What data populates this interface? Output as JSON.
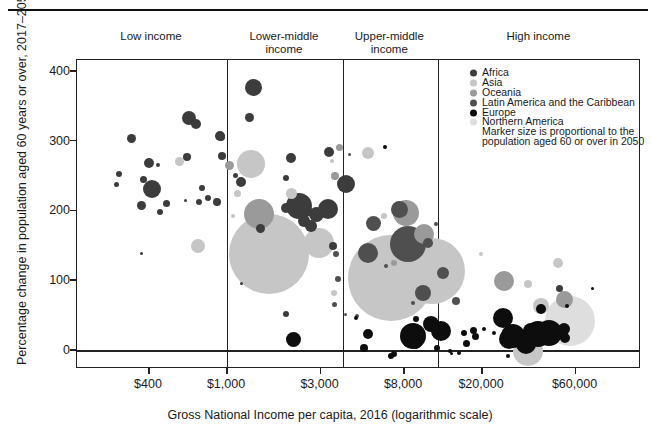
{
  "figure": {
    "y_axis_title": "Percentage change in population aged 60 years or over, 2017–2050",
    "x_axis_title": "Gross National Income per capita, 2016 (logarithmic scale)",
    "income_groups": [
      "Low income",
      "Lower-middle\nincome",
      "Upper-middle\nincome",
      "High income"
    ],
    "legend": {
      "items": [
        {
          "label": "Africa",
          "color": "#3c3c3c"
        },
        {
          "label": "Asia",
          "color": "#c6c6c6"
        },
        {
          "label": "Oceania",
          "color": "#9a9a9a"
        },
        {
          "label": "Latin America and the Caribbean",
          "color": "#4f4f4f"
        },
        {
          "label": "Europe",
          "color": "#0d0d0d"
        },
        {
          "label": "Northern America",
          "color": "#dedede"
        }
      ],
      "note_lines": [
        "Marker size is proportional to the",
        "population aged 60 or over in 2050"
      ]
    }
  },
  "chart_data": {
    "type": "scatter",
    "x_scale": "log",
    "xlabel": "Gross National Income per capita, 2016 (logarithmic scale)",
    "ylabel": "Percentage change in population aged 60 years or over, 2017–2050",
    "x_ticks": [
      400,
      1000,
      3000,
      8000,
      20000,
      60000
    ],
    "x_tick_labels": [
      "$400",
      "$1,000",
      "$3,000",
      "$8,000",
      "$20,000",
      "$60,000"
    ],
    "y_ticks": [
      0,
      100,
      200,
      300,
      400
    ],
    "y_tick_labels": [
      "0",
      "100",
      "200",
      "300",
      "400"
    ],
    "xlim": [
      240,
      110000
    ],
    "ylim": [
      -26,
      417
    ],
    "grid": false,
    "legend_position": "top-right-inside",
    "group_boundaries_gni": [
      1000,
      3900,
      11900
    ],
    "zero_line": 0,
    "series": [
      {
        "name": "Africa",
        "color": "#3c3c3c",
        "points": [
          [
            640,
            334,
            7
          ],
          [
            695,
            325,
            5
          ],
          [
            325,
            305,
            4.5
          ],
          [
            400,
            269,
            5
          ],
          [
            445,
            266,
            2
          ],
          [
            625,
            278,
            4
          ],
          [
            282,
            254,
            3
          ],
          [
            272,
            239,
            2.5
          ],
          [
            377,
            246,
            3.5
          ],
          [
            415,
            232,
            9
          ],
          [
            365,
            208,
            4.5
          ],
          [
            490,
            212,
            3.5
          ],
          [
            617,
            216,
            1.5
          ],
          [
            720,
            213,
            3
          ],
          [
            745,
            233,
            3
          ],
          [
            800,
            219,
            3
          ],
          [
            455,
            199,
            3
          ],
          [
            890,
            213,
            4
          ],
          [
            368,
            140,
            1.5
          ],
          [
            920,
            308,
            5
          ],
          [
            1360,
            377,
            8.5
          ],
          [
            1295,
            335,
            4.5
          ],
          [
            930,
            307,
            4
          ],
          [
            945,
            279,
            4
          ],
          [
            1110,
            252,
            2.5
          ],
          [
            1180,
            242,
            5
          ],
          [
            2120,
            277,
            5
          ],
          [
            1995,
            248,
            3
          ],
          [
            2330,
            208,
            13
          ],
          [
            1490,
            176,
            4.5
          ],
          [
            1995,
            205,
            5
          ],
          [
            2250,
            198,
            5
          ],
          [
            2470,
            186,
            6
          ],
          [
            1180,
            97,
            1.5
          ],
          [
            1995,
            53,
            3
          ],
          [
            2530,
            201,
            6
          ],
          [
            2850,
            196,
            7.5
          ],
          [
            3280,
            203,
            10
          ],
          [
            2690,
            179,
            6
          ],
          [
            3480,
            150,
            4
          ],
          [
            3320,
            285,
            5
          ],
          [
            4050,
            239,
            9
          ],
          [
            49500,
            89,
            3.5
          ]
        ]
      },
      {
        "name": "Asia",
        "color": "#c6c6c6",
        "points": [
          [
            570,
            271,
            4.5
          ],
          [
            710,
            150,
            7
          ],
          [
            1330,
            268,
            14
          ],
          [
            1125,
            226,
            3.5
          ],
          [
            2145,
            226,
            5.5
          ],
          [
            1640,
            139,
            40
          ],
          [
            1070,
            193,
            2
          ],
          [
            2950,
            155,
            15
          ],
          [
            3520,
            83,
            3
          ],
          [
            5240,
            284,
            6
          ],
          [
            3430,
            272,
            2
          ],
          [
            6310,
            193,
            3
          ],
          [
            6130,
            150,
            5
          ],
          [
            6870,
            105,
            43
          ],
          [
            5440,
            89,
            12
          ],
          [
            11100,
            115,
            33
          ],
          [
            19700,
            139,
            2
          ],
          [
            34400,
            96,
            4
          ],
          [
            48900,
            126,
            5
          ],
          [
            34400,
            0,
            15
          ],
          [
            40200,
            64,
            8
          ]
        ]
      },
      {
        "name": "Oceania",
        "color": "#9a9a9a",
        "points": [
          [
            1035,
            266,
            4.5
          ],
          [
            1460,
            196,
            15
          ],
          [
            3740,
            292,
            3.5
          ],
          [
            3560,
            251,
            4
          ],
          [
            8180,
            198,
            13
          ],
          [
            10100,
            168,
            10
          ],
          [
            7130,
            126,
            3
          ],
          [
            26000,
            100,
            10
          ],
          [
            52500,
            74,
            8.5
          ]
        ]
      },
      {
        "name": "Latin America and the Caribbean",
        "color": "#4f4f4f",
        "points": [
          [
            3600,
            139,
            3
          ],
          [
            3690,
            103,
            3
          ],
          [
            3520,
            67,
            2.5
          ],
          [
            4240,
            282,
            1.5
          ],
          [
            5560,
            183,
            7.5
          ],
          [
            7620,
            203,
            8.5
          ],
          [
            8370,
            153,
            18
          ],
          [
            10600,
            155,
            5
          ],
          [
            5240,
            140,
            10
          ],
          [
            10000,
            83,
            8
          ],
          [
            4000,
            53,
            1.5
          ],
          [
            4630,
            50,
            2
          ],
          [
            6500,
            122,
            2
          ],
          [
            8900,
            69,
            2
          ],
          [
            12700,
            112,
            6
          ],
          [
            11650,
            182,
            2
          ],
          [
            14700,
            72,
            4
          ]
        ]
      },
      {
        "name": "Europe",
        "color": "#0d0d0d",
        "points": [
          [
            6420,
            292,
            2
          ],
          [
            2175,
            17,
            7.5
          ],
          [
            9220,
            46,
            3
          ],
          [
            8900,
            21,
            13
          ],
          [
            9220,
            10,
            5
          ],
          [
            5240,
            24,
            5
          ],
          [
            4990,
            4,
            4
          ],
          [
            4550,
            47,
            2
          ],
          [
            6870,
            -7,
            3
          ],
          [
            12790,
            33,
            2
          ],
          [
            13900,
            -3,
            1.5
          ],
          [
            11850,
            4,
            3
          ],
          [
            54400,
            64,
            2
          ],
          [
            25700,
            47,
            10
          ],
          [
            40200,
            60,
            5
          ],
          [
            43800,
            26,
            13
          ],
          [
            52500,
            31,
            6
          ],
          [
            53000,
            19,
            5
          ],
          [
            38700,
            24,
            13
          ],
          [
            35600,
            29,
            8
          ],
          [
            33600,
            10,
            10
          ],
          [
            28700,
            21,
            12
          ],
          [
            16200,
            26,
            3
          ],
          [
            18200,
            29,
            3.5
          ],
          [
            20500,
            32,
            2
          ],
          [
            23100,
            26,
            2
          ],
          [
            16600,
            11,
            3.5
          ],
          [
            13700,
            0,
            2
          ],
          [
            15300,
            -3,
            2
          ],
          [
            27200,
            -7,
            2
          ],
          [
            11000,
            39,
            8
          ],
          [
            12700,
            29,
            5
          ],
          [
            12400,
            29,
            10
          ],
          [
            18600,
            21,
            3.5
          ],
          [
            27500,
            17,
            10
          ],
          [
            7100,
            -4,
            3
          ],
          [
            73100,
            90,
            1.5
          ]
        ]
      },
      {
        "name": "Northern America",
        "color": "#dedede",
        "points": [
          [
            56300,
            43,
            25
          ]
        ]
      }
    ]
  }
}
